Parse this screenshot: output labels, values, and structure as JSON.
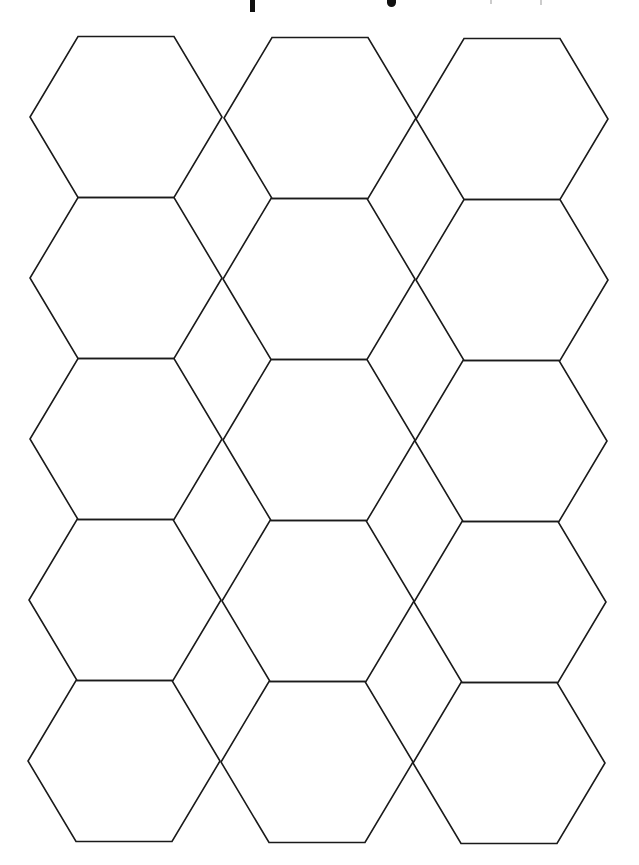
{
  "page": {
    "title_visible_fragment": "",
    "background_color": "#ffffff",
    "line_color": "#1a1a1a"
  },
  "hex_grid": {
    "rows": 5,
    "columns": 3,
    "hex_half_width": 96,
    "hex_top_half_width": 48,
    "hex_half_height": 80.5,
    "cells": [
      {
        "row": 1,
        "col": 1,
        "cx": 126,
        "cy": 117
      },
      {
        "row": 1,
        "col": 2,
        "cx": 320,
        "cy": 118
      },
      {
        "row": 1,
        "col": 3,
        "cx": 512,
        "cy": 119
      },
      {
        "row": 2,
        "col": 1,
        "cx": 126,
        "cy": 278
      },
      {
        "row": 2,
        "col": 2,
        "cx": 319,
        "cy": 279
      },
      {
        "row": 2,
        "col": 3,
        "cx": 512,
        "cy": 280
      },
      {
        "row": 3,
        "col": 1,
        "cx": 126,
        "cy": 439
      },
      {
        "row": 3,
        "col": 2,
        "cx": 319,
        "cy": 440
      },
      {
        "row": 3,
        "col": 3,
        "cx": 511,
        "cy": 441
      },
      {
        "row": 4,
        "col": 1,
        "cx": 125,
        "cy": 600
      },
      {
        "row": 4,
        "col": 2,
        "cx": 318,
        "cy": 601
      },
      {
        "row": 4,
        "col": 3,
        "cx": 510,
        "cy": 602
      },
      {
        "row": 5,
        "col": 1,
        "cx": 124,
        "cy": 761
      },
      {
        "row": 5,
        "col": 2,
        "cx": 317,
        "cy": 762
      },
      {
        "row": 5,
        "col": 3,
        "cx": 509,
        "cy": 763
      }
    ]
  }
}
